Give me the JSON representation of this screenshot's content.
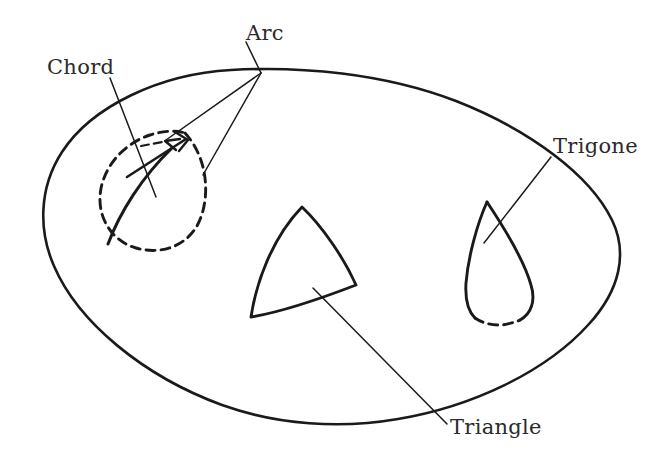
{
  "figure": {
    "background_color": "#ffffff",
    "ink_color": "#1a1a1a",
    "label_color": "#2b2b2b",
    "width": 653,
    "height": 457
  },
  "labels": {
    "chord": "Chord",
    "arc": "Arc",
    "trigone": "Trigone",
    "triangle": "Triangle"
  },
  "shapes": {
    "outer_oval": {
      "name": "outer-oval",
      "line_style": "solid",
      "description": "Large hand-drawn oval boundary enclosing all inner figures"
    },
    "left_region": {
      "name": "chord-arc-region",
      "line_style": "dashed",
      "description": "Dashed teardrop region crossed by a solid curved chord"
    },
    "center_region": {
      "name": "triangle-region",
      "line_style": "solid",
      "description": "Curved-sided triangle with three solid arcs"
    },
    "right_region": {
      "name": "trigone-region",
      "line_style": "solid-with-dashed-base",
      "description": "Teardrop with solid upper sides and dashed lower arc"
    }
  },
  "leaders": [
    {
      "name": "chord-leader",
      "from_label": "Chord",
      "target": "solid chord curve inside left region"
    },
    {
      "name": "arc-leader-a",
      "from_label": "Arc",
      "target": "dashed arc of left region"
    },
    {
      "name": "arc-leader-b",
      "from_label": "Arc",
      "target": "solid arc of left region"
    },
    {
      "name": "trigone-leader",
      "from_label": "Trigone",
      "target": "interior of right teardrop region"
    },
    {
      "name": "triangle-leader",
      "from_label": "Triangle",
      "target": "interior of center triangle region"
    }
  ]
}
